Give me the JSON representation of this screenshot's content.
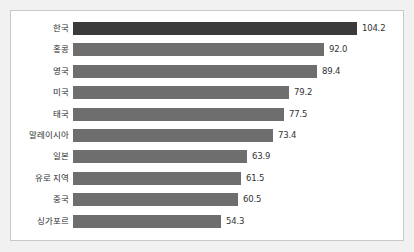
{
  "chart_data": {
    "type": "bar",
    "orientation": "horizontal",
    "title": "",
    "subtitle": "",
    "xlabel": "",
    "ylabel": "",
    "grid": false,
    "legend": false,
    "xlim": [
      0,
      104.2
    ],
    "categories": [
      "한국",
      "홍콩",
      "영국",
      "미국",
      "태국",
      "말레이시아",
      "일본",
      "유로 지역",
      "중국",
      "싱가포르"
    ],
    "values": [
      104.2,
      92.0,
      89.4,
      79.2,
      77.5,
      73.4,
      63.9,
      61.5,
      60.5,
      54.3
    ],
    "value_labels": [
      "104.2",
      "92.0",
      "89.4",
      "79.2",
      "77.5",
      "73.4",
      "63.9",
      "61.5",
      "60.5",
      "54.3"
    ],
    "highlight_index": 0,
    "colors": {
      "bar": "#6e6e6e",
      "bar_highlight": "#3a3a3a",
      "panel_background": "#ffffff",
      "frame_background": "#f1f1f1",
      "panel_border": "#c8c8c8",
      "category_text": "#2e2e2e",
      "value_text": "#333333"
    }
  }
}
